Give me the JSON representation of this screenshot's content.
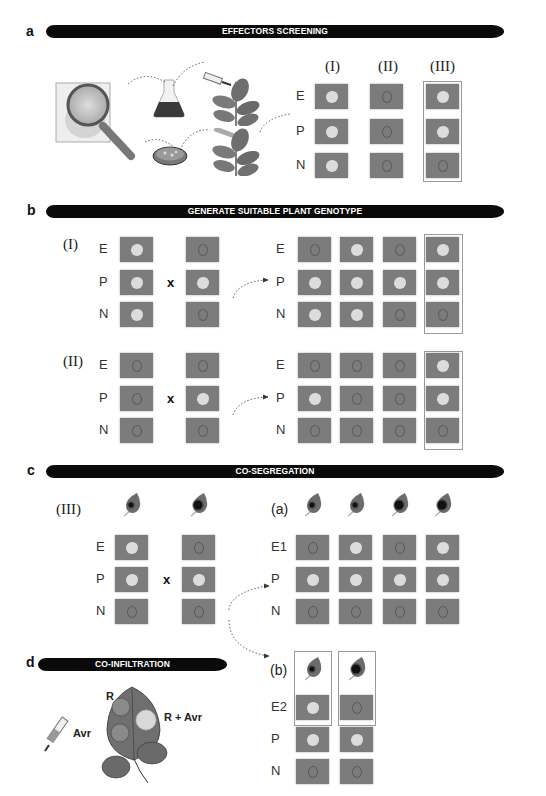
{
  "colors": {
    "banner": "#0a0a0a",
    "square": "#7c7c7c",
    "necrosis_spot": "#dcdcdc",
    "box_outline": "#9a9a9a"
  },
  "panel_a": {
    "letter": "a",
    "banner": "EFFECTORS SCREENING",
    "icons": [
      "magnifying-glass-icon",
      "flask-icon",
      "syringe-icon",
      "petri-dish-icon",
      "plant-icon",
      "plant-icon"
    ],
    "columns": [
      "(I)",
      "(II)",
      "(III)"
    ],
    "rows": [
      "E",
      "P",
      "N"
    ],
    "grid": [
      [
        "spot",
        "ring",
        "spot"
      ],
      [
        "spot",
        "ring",
        "spot"
      ],
      [
        "spot",
        "ring",
        "ring"
      ]
    ],
    "highlighted_column": "(III)"
  },
  "panel_b": {
    "letter": "b",
    "banner": "GENERATE SUITABLE PLANT GENOTYPE",
    "cross_symbol": "x",
    "groups": [
      {
        "label": "(I)",
        "rows": [
          "E",
          "P",
          "N"
        ],
        "parent1": [
          "spot",
          "spot",
          "spot"
        ],
        "parent2": [
          "ring",
          "spot",
          "ring"
        ],
        "offspring_rows": [
          "E",
          "P",
          "N"
        ],
        "offspring": [
          [
            "ring",
            "spot",
            "ring",
            "spot"
          ],
          [
            "spot",
            "spot",
            "spot",
            "spot"
          ],
          [
            "spot",
            "spot",
            "ring",
            "ring"
          ]
        ]
      },
      {
        "label": "(II)",
        "rows": [
          "E",
          "P",
          "N"
        ],
        "parent1": [
          "ring",
          "ring",
          "ring"
        ],
        "parent2": [
          "ring",
          "spot",
          "ring"
        ],
        "offspring_rows": [
          "E",
          "P",
          "N"
        ],
        "offspring": [
          [
            "ring",
            "ring",
            "ring",
            "spot"
          ],
          [
            "spot",
            "ring",
            "ring",
            "spot"
          ],
          [
            "ring",
            "ring",
            "ring",
            "ring"
          ]
        ]
      }
    ]
  },
  "panel_c": {
    "letter": "c",
    "banner": "CO-SEGREGATION",
    "cross_symbol": "x",
    "parent_label": "(III)",
    "rows": [
      "E",
      "P",
      "N"
    ],
    "parent_leaves": [
      "small-lesion",
      "large-lesion"
    ],
    "parent1": [
      "spot",
      "spot",
      "ring"
    ],
    "parent2": [
      "ring",
      "spot",
      "ring"
    ],
    "sub_a": {
      "label": "(a)",
      "rows": [
        "E1",
        "P",
        "N"
      ],
      "leaves": [
        "small-lesion",
        "small-lesion",
        "large-lesion",
        "large-lesion"
      ],
      "grid": [
        [
          "ring",
          "spot",
          "ring",
          "spot"
        ],
        [
          "spot",
          "spot",
          "spot",
          "spot"
        ],
        [
          "ring",
          "ring",
          "ring",
          "ring"
        ]
      ]
    },
    "sub_b": {
      "label": "(b)",
      "rows": [
        "E2",
        "P",
        "N"
      ],
      "leaves": [
        "small-lesion",
        "large-lesion"
      ],
      "grid": [
        [
          "spot",
          "ring"
        ],
        [
          "spot",
          "spot"
        ],
        [
          "ring",
          "ring"
        ]
      ]
    }
  },
  "panel_d": {
    "letter": "d",
    "banner": "CO-INFILTRATION",
    "label_r": "R",
    "label_r_avr": "R + Avr",
    "label_avr": "Avr"
  }
}
